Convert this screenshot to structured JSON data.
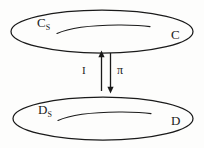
{
  "diagram": {
    "type": "category-adjunction-diagram",
    "background_color": "#fdfdfc",
    "stroke_color": "#1a1a1a",
    "top_region": {
      "outer_label": "C",
      "subset_label": "C",
      "subset_subscript": "S",
      "shape": "ellipse",
      "inner_curve": "subset-squiggle"
    },
    "bottom_region": {
      "outer_label": "D",
      "subset_label": "D",
      "subset_subscript": "S",
      "shape": "ellipse",
      "inner_curve": "subset-squiggle"
    },
    "arrows": [
      {
        "name": "inclusion",
        "label": "I",
        "direction": "up",
        "from": "bottom_region",
        "to": "top_region"
      },
      {
        "name": "projection",
        "label": "π",
        "direction": "down",
        "from": "top_region",
        "to": "bottom_region"
      }
    ]
  }
}
